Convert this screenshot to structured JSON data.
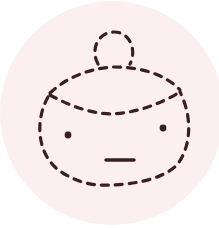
{
  "illustration": {
    "label": "Dashed-line character face with a hair bun",
    "colors": {
      "page_background": "#ffffff",
      "circle_fill": "#fbf0ef",
      "stroke": "#3a1f22"
    }
  }
}
